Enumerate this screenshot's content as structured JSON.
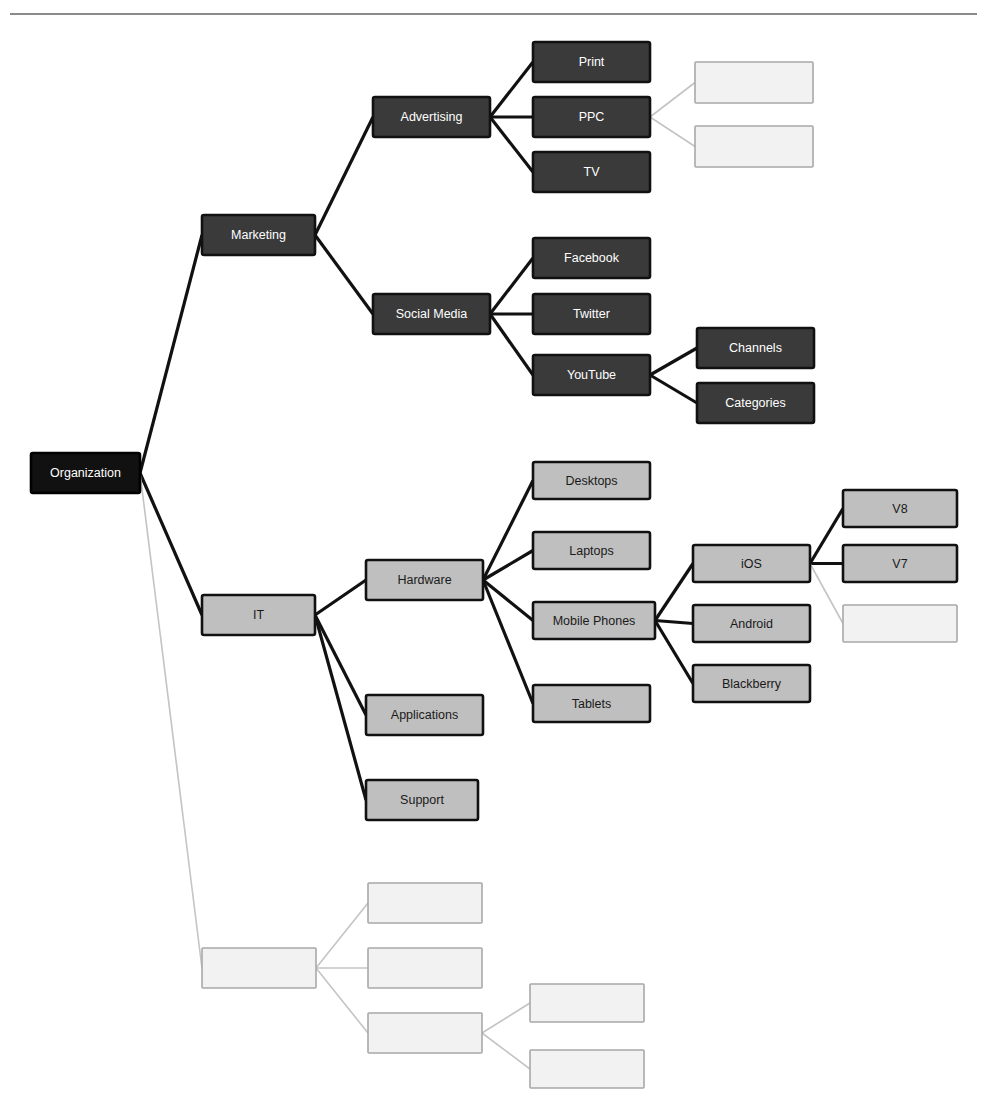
{
  "page": {
    "header_partial_text": "",
    "background_color": "#ffffff",
    "rule_color": "#8a8a8a",
    "width": 987,
    "height": 1109
  },
  "styles": {
    "root": {
      "fill": "#111111",
      "stroke": "#000000",
      "text": "#ffffff"
    },
    "dark": {
      "fill": "#3a3a3a",
      "stroke": "#111111",
      "text": "#ffffff"
    },
    "light": {
      "fill": "#bfbfbf",
      "stroke": "#111111",
      "text": "#1a1a1a"
    },
    "ghost": {
      "fill": "#f2f2f2",
      "stroke": "#a8a8a8",
      "text": "#f2f2f2"
    },
    "edge_dark": "#111111",
    "edge_ghost": "#c4c4c4"
  },
  "diagram": {
    "type": "tree",
    "orientation": "left-to-right",
    "root": "Organization",
    "nodes": [
      {
        "id": "organization",
        "label": "Organization",
        "style": "root",
        "x": 31,
        "y": 453,
        "w": 109,
        "h": 40,
        "level": 0
      },
      {
        "id": "marketing",
        "label": "Marketing",
        "style": "dark",
        "x": 202,
        "y": 215,
        "w": 113,
        "h": 40,
        "level": 1
      },
      {
        "id": "advertising",
        "label": "Advertising",
        "style": "dark",
        "x": 373,
        "y": 97,
        "w": 117,
        "h": 40,
        "level": 2
      },
      {
        "id": "print",
        "label": "Print",
        "style": "dark",
        "x": 533,
        "y": 42,
        "w": 117,
        "h": 40,
        "level": 3
      },
      {
        "id": "ppc",
        "label": "PPC",
        "style": "dark",
        "x": 533,
        "y": 97,
        "w": 117,
        "h": 40,
        "level": 3
      },
      {
        "id": "tv",
        "label": "TV",
        "style": "dark",
        "x": 533,
        "y": 152,
        "w": 117,
        "h": 40,
        "level": 3
      },
      {
        "id": "ppc-child-1",
        "label": "",
        "style": "ghost",
        "x": 695,
        "y": 62,
        "w": 118,
        "h": 41,
        "level": 4
      },
      {
        "id": "ppc-child-2",
        "label": "",
        "style": "ghost",
        "x": 695,
        "y": 126,
        "w": 118,
        "h": 41,
        "level": 4
      },
      {
        "id": "social-media",
        "label": "Social Media",
        "style": "dark",
        "x": 373,
        "y": 294,
        "w": 117,
        "h": 40,
        "level": 2
      },
      {
        "id": "facebook",
        "label": "Facebook",
        "style": "dark",
        "x": 533,
        "y": 238,
        "w": 117,
        "h": 40,
        "level": 3
      },
      {
        "id": "twitter",
        "label": "Twitter",
        "style": "dark",
        "x": 533,
        "y": 294,
        "w": 117,
        "h": 40,
        "level": 3
      },
      {
        "id": "youtube",
        "label": "YouTube",
        "style": "dark",
        "x": 533,
        "y": 355,
        "w": 117,
        "h": 40,
        "level": 3
      },
      {
        "id": "channels",
        "label": "Channels",
        "style": "dark",
        "x": 697,
        "y": 328,
        "w": 117,
        "h": 40,
        "level": 4
      },
      {
        "id": "categories",
        "label": "Categories",
        "style": "dark",
        "x": 697,
        "y": 383,
        "w": 117,
        "h": 40,
        "level": 4
      },
      {
        "id": "it",
        "label": "IT",
        "style": "light",
        "x": 202,
        "y": 595,
        "w": 113,
        "h": 40,
        "level": 1
      },
      {
        "id": "hardware",
        "label": "Hardware",
        "style": "light",
        "x": 366,
        "y": 560,
        "w": 117,
        "h": 40,
        "level": 2
      },
      {
        "id": "desktops",
        "label": "Desktops",
        "style": "light",
        "x": 533,
        "y": 462,
        "w": 117,
        "h": 37,
        "level": 3
      },
      {
        "id": "laptops",
        "label": "Laptops",
        "style": "light",
        "x": 533,
        "y": 532,
        "w": 117,
        "h": 37,
        "level": 3
      },
      {
        "id": "mobile-phones",
        "label": "Mobile Phones",
        "style": "light",
        "x": 533,
        "y": 602,
        "w": 122,
        "h": 37,
        "level": 3
      },
      {
        "id": "tablets",
        "label": "Tablets",
        "style": "light",
        "x": 533,
        "y": 685,
        "w": 117,
        "h": 37,
        "level": 3
      },
      {
        "id": "ios",
        "label": "iOS",
        "style": "light",
        "x": 693,
        "y": 545,
        "w": 117,
        "h": 37,
        "level": 4
      },
      {
        "id": "android",
        "label": "Android",
        "style": "light",
        "x": 693,
        "y": 605,
        "w": 117,
        "h": 37,
        "level": 4
      },
      {
        "id": "blackberry",
        "label": "Blackberry",
        "style": "light",
        "x": 693,
        "y": 665,
        "w": 117,
        "h": 37,
        "level": 4
      },
      {
        "id": "v8",
        "label": "V8",
        "style": "light",
        "x": 843,
        "y": 490,
        "w": 114,
        "h": 37,
        "level": 5
      },
      {
        "id": "v7",
        "label": "V7",
        "style": "light",
        "x": 843,
        "y": 545,
        "w": 114,
        "h": 37,
        "level": 5
      },
      {
        "id": "ios-child-3",
        "label": "",
        "style": "ghost",
        "x": 843,
        "y": 605,
        "w": 114,
        "h": 37,
        "level": 5
      },
      {
        "id": "applications",
        "label": "Applications",
        "style": "light",
        "x": 366,
        "y": 695,
        "w": 117,
        "h": 40,
        "level": 2
      },
      {
        "id": "support",
        "label": "Support",
        "style": "light",
        "x": 366,
        "y": 780,
        "w": 112,
        "h": 40,
        "level": 2
      },
      {
        "id": "ghost-branch",
        "label": "",
        "style": "ghost",
        "x": 202,
        "y": 948,
        "w": 114,
        "h": 40,
        "level": 1
      },
      {
        "id": "ghost-child-1",
        "label": "",
        "style": "ghost",
        "x": 368,
        "y": 883,
        "w": 114,
        "h": 40,
        "level": 2
      },
      {
        "id": "ghost-child-2",
        "label": "",
        "style": "ghost",
        "x": 368,
        "y": 948,
        "w": 114,
        "h": 40,
        "level": 2
      },
      {
        "id": "ghost-child-3",
        "label": "",
        "style": "ghost",
        "x": 368,
        "y": 1013,
        "w": 114,
        "h": 40,
        "level": 2
      },
      {
        "id": "ghost-gchild-1",
        "label": "",
        "style": "ghost",
        "x": 530,
        "y": 984,
        "w": 114,
        "h": 38,
        "level": 3
      },
      {
        "id": "ghost-gchild-2",
        "label": "",
        "style": "ghost",
        "x": 530,
        "y": 1050,
        "w": 114,
        "h": 38,
        "level": 3
      }
    ],
    "edges": [
      {
        "from": "organization",
        "to": "marketing",
        "style": "dark"
      },
      {
        "from": "organization",
        "to": "it",
        "style": "dark"
      },
      {
        "from": "organization",
        "to": "ghost-branch",
        "style": "ghost"
      },
      {
        "from": "marketing",
        "to": "advertising",
        "style": "dark"
      },
      {
        "from": "marketing",
        "to": "social-media",
        "style": "dark"
      },
      {
        "from": "advertising",
        "to": "print",
        "style": "dark"
      },
      {
        "from": "advertising",
        "to": "ppc",
        "style": "dark"
      },
      {
        "from": "advertising",
        "to": "tv",
        "style": "dark"
      },
      {
        "from": "ppc",
        "to": "ppc-child-1",
        "style": "ghost"
      },
      {
        "from": "ppc",
        "to": "ppc-child-2",
        "style": "ghost"
      },
      {
        "from": "social-media",
        "to": "facebook",
        "style": "dark"
      },
      {
        "from": "social-media",
        "to": "twitter",
        "style": "dark"
      },
      {
        "from": "social-media",
        "to": "youtube",
        "style": "dark"
      },
      {
        "from": "youtube",
        "to": "channels",
        "style": "dark"
      },
      {
        "from": "youtube",
        "to": "categories",
        "style": "dark"
      },
      {
        "from": "it",
        "to": "hardware",
        "style": "dark"
      },
      {
        "from": "it",
        "to": "applications",
        "style": "dark"
      },
      {
        "from": "it",
        "to": "support",
        "style": "dark"
      },
      {
        "from": "hardware",
        "to": "desktops",
        "style": "dark"
      },
      {
        "from": "hardware",
        "to": "laptops",
        "style": "dark"
      },
      {
        "from": "hardware",
        "to": "mobile-phones",
        "style": "dark"
      },
      {
        "from": "hardware",
        "to": "tablets",
        "style": "dark"
      },
      {
        "from": "mobile-phones",
        "to": "ios",
        "style": "dark"
      },
      {
        "from": "mobile-phones",
        "to": "android",
        "style": "dark"
      },
      {
        "from": "mobile-phones",
        "to": "blackberry",
        "style": "dark"
      },
      {
        "from": "ios",
        "to": "v8",
        "style": "dark"
      },
      {
        "from": "ios",
        "to": "v7",
        "style": "dark"
      },
      {
        "from": "ios",
        "to": "ios-child-3",
        "style": "ghost"
      },
      {
        "from": "ghost-branch",
        "to": "ghost-child-1",
        "style": "ghost"
      },
      {
        "from": "ghost-branch",
        "to": "ghost-child-2",
        "style": "ghost"
      },
      {
        "from": "ghost-branch",
        "to": "ghost-child-3",
        "style": "ghost"
      },
      {
        "from": "ghost-child-3",
        "to": "ghost-gchild-1",
        "style": "ghost"
      },
      {
        "from": "ghost-child-3",
        "to": "ghost-gchild-2",
        "style": "ghost"
      }
    ]
  }
}
